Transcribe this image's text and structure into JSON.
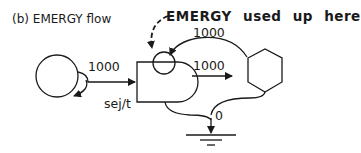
{
  "diagram": {
    "title": "(b) EMERGY flow",
    "annotation": "EMERGY used up here",
    "flows": {
      "input": "1000",
      "feedback": "1000",
      "output": "1000",
      "heat_sink": "0"
    },
    "unit": "sej/t",
    "nodes": [
      {
        "type": "source",
        "shape": "circle"
      },
      {
        "type": "storage",
        "shape": "tank"
      },
      {
        "type": "interaction",
        "shape": "small-circle"
      },
      {
        "type": "consumer",
        "shape": "hexagon"
      },
      {
        "type": "heat-sink",
        "shape": "ground"
      }
    ],
    "colors": {
      "stroke": "#1a1a1a",
      "background": "#ffffff"
    }
  }
}
